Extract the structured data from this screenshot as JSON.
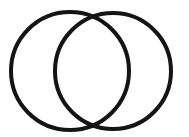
{
  "canvas": {
    "width": 189,
    "height": 137,
    "background_color": "#ffffff",
    "alt_text": "Two large black outlined circles overlapping side by side, forming a Venn-diagram / vesica piscis shape"
  },
  "figure": {
    "name": "two-overlapping-circles",
    "type": "line-drawing",
    "stroke_color": "#141414",
    "stroke_width": 4,
    "fill": "none",
    "shape_count": 2
  },
  "shapes": [
    {
      "id": "left-circle",
      "label": "Left circle",
      "cx": 70,
      "cy": 71,
      "r": 59,
      "stroke_color": "#141414",
      "stroke_width": 4
    },
    {
      "id": "right-circle",
      "label": "Right circle",
      "cx": 113,
      "cy": 71,
      "r": 58,
      "stroke_color": "#141414",
      "stroke_width": 4
    }
  ],
  "intersections": [
    {
      "id": "top-crossing",
      "x": 92,
      "y": 17
    },
    {
      "id": "bottom-crossing",
      "x": 92,
      "y": 124
    }
  ],
  "chart_data": {
    "type": "scatter",
    "title": "",
    "xlabel": "",
    "ylabel": "",
    "grid": false,
    "legend": "none",
    "xlim": [
      0,
      189
    ],
    "ylim": [
      0,
      137
    ],
    "series": [
      {
        "name": "Left circle",
        "values": [
          70,
          71,
          59
        ]
      },
      {
        "name": "Right circle",
        "values": [
          113,
          71,
          58
        ]
      }
    ]
  }
}
